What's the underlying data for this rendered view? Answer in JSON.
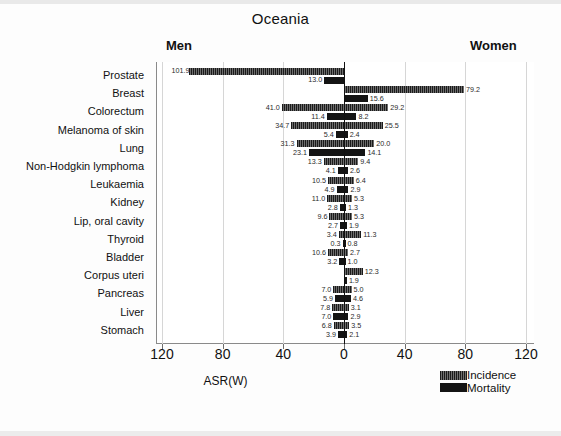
{
  "chart_data": {
    "type": "bar",
    "subtype": "diverging-population-pyramid",
    "title": "Oceania",
    "xlabel": "ASR(W)",
    "ylabel": "",
    "left_group_label": "Men",
    "right_group_label": "Women",
    "xlim": [
      -120,
      120
    ],
    "xticks": [
      120,
      80,
      40,
      0,
      40,
      80,
      120
    ],
    "xtick_values": [
      -120,
      -80,
      -40,
      0,
      40,
      80,
      120
    ],
    "grid": "vertical",
    "legend_position": "bottom-right",
    "legend": [
      "Incidence",
      "Mortality"
    ],
    "categories": [
      "Prostate",
      "Breast",
      "Colorectum",
      "Melanoma of skin",
      "Lung",
      "Non-Hodgkin lymphoma",
      "Leukaemia",
      "Kidney",
      "Lip, oral cavity",
      "Thyroid",
      "Bladder",
      "Corpus uteri",
      "Pancreas",
      "Liver",
      "Stomach"
    ],
    "series": [
      {
        "name": "Incidence",
        "men": [
          101.9,
          null,
          41.0,
          34.7,
          31.3,
          13.3,
          10.5,
          11.0,
          9.6,
          3.4,
          10.6,
          null,
          7.0,
          7.8,
          6.8
        ],
        "women": [
          null,
          79.2,
          29.2,
          25.5,
          20.0,
          9.4,
          6.4,
          5.3,
          5.3,
          11.3,
          2.7,
          12.3,
          5.0,
          3.1,
          3.5
        ]
      },
      {
        "name": "Mortality",
        "men": [
          13.0,
          null,
          11.4,
          5.4,
          23.1,
          4.1,
          4.9,
          2.8,
          2.7,
          0.3,
          3.2,
          null,
          5.9,
          7.0,
          3.9
        ],
        "women": [
          null,
          15.6,
          8.2,
          2.4,
          14.1,
          2.6,
          2.9,
          1.3,
          1.9,
          0.8,
          1.0,
          1.9,
          4.6,
          2.9,
          2.1
        ]
      }
    ],
    "rows": [
      {
        "category": "Prostate",
        "inc_men": 101.9,
        "inc_women": null,
        "mor_men": 13.0,
        "mor_women": null
      },
      {
        "category": "Breast",
        "inc_men": null,
        "inc_women": 79.2,
        "mor_men": null,
        "mor_women": 15.6
      },
      {
        "category": "Colorectum",
        "inc_men": 41.0,
        "inc_women": 29.2,
        "mor_men": 11.4,
        "mor_women": 8.2
      },
      {
        "category": "Melanoma of skin",
        "inc_men": 34.7,
        "inc_women": 25.5,
        "mor_men": 5.4,
        "mor_women": 2.4
      },
      {
        "category": "Lung",
        "inc_men": 31.3,
        "inc_women": 20.0,
        "mor_men": 23.1,
        "mor_women": 14.1
      },
      {
        "category": "Non-Hodgkin lymphoma",
        "inc_men": 13.3,
        "inc_women": 9.4,
        "mor_men": 4.1,
        "mor_women": 2.6
      },
      {
        "category": "Leukaemia",
        "inc_men": 10.5,
        "inc_women": 6.4,
        "mor_men": 4.9,
        "mor_women": 2.9
      },
      {
        "category": "Kidney",
        "inc_men": 11.0,
        "inc_women": 5.3,
        "mor_men": 2.8,
        "mor_women": 1.3
      },
      {
        "category": "Lip, oral cavity",
        "inc_men": 9.6,
        "inc_women": 5.3,
        "mor_men": 2.7,
        "mor_women": 1.9
      },
      {
        "category": "Thyroid",
        "inc_men": 3.4,
        "inc_women": 11.3,
        "mor_men": 0.3,
        "mor_women": 0.8
      },
      {
        "category": "Bladder",
        "inc_men": 10.6,
        "inc_women": 2.7,
        "mor_men": 3.2,
        "mor_women": 1.0
      },
      {
        "category": "Corpus uteri",
        "inc_men": null,
        "inc_women": 12.3,
        "mor_men": null,
        "mor_women": 1.9
      },
      {
        "category": "Pancreas",
        "inc_men": 7.0,
        "inc_women": 5.0,
        "mor_men": 5.9,
        "mor_women": 4.6
      },
      {
        "category": "Liver",
        "inc_men": 7.8,
        "inc_women": 3.1,
        "mor_men": 7.0,
        "mor_women": 2.9
      },
      {
        "category": "Stomach",
        "inc_men": 6.8,
        "inc_women": 3.5,
        "mor_men": 3.9,
        "mor_women": 2.1
      }
    ]
  },
  "colors": {
    "incidence": "#232323",
    "mortality": "#141414",
    "grid": "#d6d6d6",
    "axis": "#8a8a8a",
    "background": "#ffffff"
  }
}
